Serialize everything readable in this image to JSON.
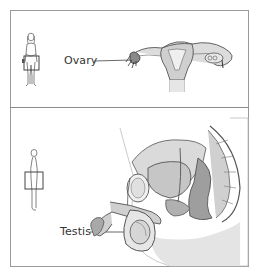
{
  "figure": {
    "panels": [
      {
        "id": "female",
        "label": "Ovary",
        "body_icon": "female-figure-icon",
        "region_marker": "pelvic-region-box",
        "illustration": "uterus-ovaries-illustration"
      },
      {
        "id": "male",
        "label": "Testis",
        "body_icon": "male-figure-side-icon",
        "region_marker": "pelvic-region-box",
        "illustration": "male-pelvis-sagittal-illustration"
      }
    ]
  },
  "colors": {
    "frame": "#9a9a9a",
    "line": "#555555",
    "tissue": "#d9d9d9",
    "tissue_dark": "#b5b5b5",
    "label": "#333333"
  }
}
